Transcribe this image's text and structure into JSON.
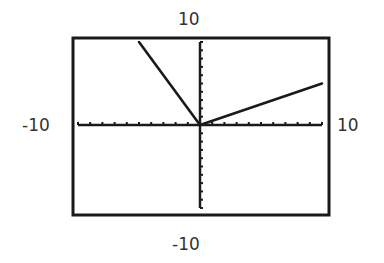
{
  "window": {
    "xmin_label": "-10",
    "xmax_label": "10",
    "ymin_label": "-10",
    "ymax_label": "10"
  },
  "chart_data": {
    "type": "line",
    "title": "",
    "xlabel": "",
    "ylabel": "",
    "xlim": [
      -10,
      10
    ],
    "ylim": [
      -10,
      10
    ],
    "grid": false,
    "xscale_ticks": 1,
    "yscale_ticks": 1,
    "series": [
      {
        "name": "f(x), x<0",
        "x": [
          -5,
          0
        ],
        "y": [
          10,
          0
        ]
      },
      {
        "name": "f(x), x>=0",
        "x": [
          0,
          10
        ],
        "y": [
          0,
          5
        ]
      }
    ],
    "annotations": [
      "-10",
      "10",
      "-10",
      "10"
    ],
    "colors": {
      "line": "#1a1a1a",
      "axes": "#1a1a1a",
      "frame": "#1a1a1a",
      "background": "#ffffff"
    }
  }
}
